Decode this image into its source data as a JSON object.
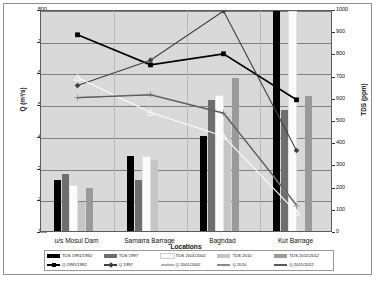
{
  "chart_data": {
    "type": "bar",
    "title": "",
    "xlabel": "Locations",
    "ylabel": "Q (m³/s)",
    "y2label": "TDS (ppm)",
    "ylim": [
      100,
      800
    ],
    "y2lim": [
      0,
      1000
    ],
    "grid": true,
    "legend_position": "bottom",
    "categories": [
      "u/s Mosul  Dam",
      "Samarra Barrage",
      "Baghdad",
      "Kut Barrage"
    ],
    "y_ticks": [
      100,
      200,
      300,
      400,
      500,
      600,
      700,
      800
    ],
    "y2_ticks": [
      0,
      100,
      200,
      300,
      400,
      500,
      600,
      700,
      800,
      900,
      1000
    ],
    "bar_series": [
      {
        "name": "TDS 1991/1992",
        "axis": "right",
        "color": "#000000",
        "values": [
          230,
          340,
          430,
          990
        ]
      },
      {
        "name": "TDS 1997",
        "axis": "right",
        "color": "#6e6e6e",
        "values": [
          255,
          230,
          590,
          545
        ]
      },
      {
        "name": "TDS 2001/2002",
        "axis": "right",
        "color": "#fbfbfb",
        "values": [
          205,
          335,
          610,
          985
        ]
      },
      {
        "name": "TDS 2010",
        "axis": "right",
        "color": "#c6c6c6",
        "values": [
          130,
          320,
          520,
          0
        ]
      },
      {
        "name": "TDS 2011/2012",
        "axis": "right",
        "color": "#9a9a9a",
        "values": [
          195,
          0,
          690,
          610
        ]
      }
    ],
    "line_series": [
      {
        "name": "Q 1991/1992",
        "axis": "left",
        "color": "#000000",
        "marker": "square-filled",
        "values": [
          725,
          630,
          665,
          520
        ]
      },
      {
        "name": "Q 1997",
        "axis": "left",
        "color": "#3f3f3f",
        "marker": "diamond-filled",
        "values": [
          565,
          645,
          800,
          360
        ]
      },
      {
        "name": "Q 2001/2002",
        "axis": "left",
        "color": "#fdfdfd",
        "marker": "triangle-open",
        "values": [
          590,
          480,
          405,
          165
        ]
      },
      {
        "name": "Q 2010",
        "axis": "left",
        "color": "#8c8c8c",
        "marker": "plus",
        "values": [
          527,
          537,
          478,
          185
        ]
      },
      {
        "name": "Q 2011/2012",
        "axis": "left",
        "color": "#5a5a5a",
        "marker": "none",
        "values": [
          527,
          535,
          478,
          190
        ]
      }
    ]
  },
  "legend": {
    "row1": [
      {
        "label": "TDS 1991/1992",
        "color": "#000000"
      },
      {
        "label": "TDS 1997",
        "color": "#6e6e6e"
      },
      {
        "label": "TDS 2001/2002",
        "color": "#fbfbfb"
      },
      {
        "label": "TDS 2010",
        "color": "#c6c6c6"
      },
      {
        "label": "TDS 2011/2012",
        "color": "#9a9a9a"
      }
    ],
    "row2": [
      {
        "label": "Q 1991/1992",
        "color": "#000000",
        "marker": "square-filled"
      },
      {
        "label": "Q 1997",
        "color": "#3f3f3f",
        "marker": "diamond-filled"
      },
      {
        "label": "Q 2001/2002",
        "color": "#b4b4b4",
        "marker": "triangle-open"
      },
      {
        "label": "Q 2010",
        "color": "#8c8c8c",
        "marker": "plus"
      },
      {
        "label": "Q 2011/2012",
        "color": "#5a5a5a",
        "marker": "none"
      }
    ]
  }
}
